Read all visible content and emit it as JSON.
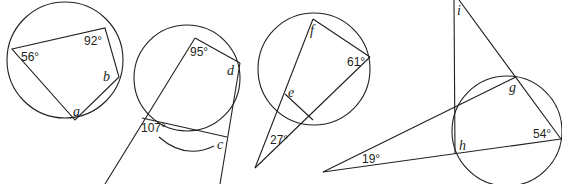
{
  "figures": [
    {
      "id": "figure-1",
      "description": "Cyclic quadrilateral inscribed in a circle",
      "angle_labels": [
        "56°",
        "92°"
      ],
      "unknowns": [
        "a",
        "b"
      ]
    },
    {
      "id": "figure-2",
      "description": "Cyclic quadrilateral with extended sides and exterior arc",
      "angle_labels": [
        "95°",
        "107°"
      ],
      "unknowns": [
        "c",
        "d"
      ]
    },
    {
      "id": "figure-3",
      "description": "Circle with two secants meeting at an external point",
      "angle_labels": [
        "61°",
        "27°"
      ],
      "unknowns": [
        "e",
        "f"
      ]
    },
    {
      "id": "figure-4",
      "description": "Circle with secants and lines meeting at external points",
      "angle_labels": [
        "19°",
        "54°"
      ],
      "unknowns": [
        "g",
        "h",
        "i"
      ]
    }
  ],
  "stroke_color": "#231f20"
}
